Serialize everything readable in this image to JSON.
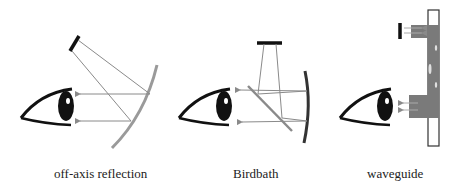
{
  "diagram": {
    "panels": [
      {
        "id": "off-axis",
        "caption": "off-axis reflection",
        "elements": [
          "eye",
          "display",
          "curved-mirror",
          "light-rays"
        ]
      },
      {
        "id": "birdbath",
        "caption": "Birdbath",
        "elements": [
          "eye",
          "display",
          "beam-splitter",
          "curved-mirror",
          "light-rays"
        ]
      },
      {
        "id": "waveguide",
        "caption": "waveguide",
        "elements": [
          "eye",
          "display",
          "waveguide-plate",
          "in-coupler",
          "out-coupler",
          "light-rays"
        ]
      }
    ]
  },
  "colors": {
    "ink": "#111111",
    "ray": "#8a8a8a",
    "mirror_gray": "#9a9a9a",
    "mirror_dark": "#333333",
    "waveguide_fill": "#7a7a7a",
    "background": "#ffffff"
  }
}
